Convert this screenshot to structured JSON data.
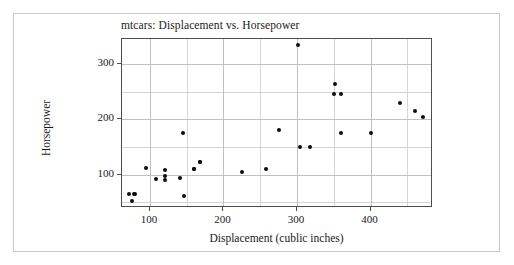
{
  "chart_data": {
    "type": "scatter",
    "title": "mtcars: Displacement vs. Horsepower",
    "xlabel": "Displacement (cublic inches)",
    "ylabel": "Horsepower",
    "xlim": [
      62,
      485
    ],
    "ylim": [
      40,
      345
    ],
    "grid": true,
    "legend": null,
    "xticks": [
      100,
      200,
      300,
      400
    ],
    "yticks": [
      100,
      200,
      300
    ],
    "x_minor_gridlines": [
      150,
      250,
      350,
      450
    ],
    "y_minor_gridlines": [
      50,
      150,
      250
    ],
    "marker": "filled-circle",
    "marker_color": "#0d0d0d",
    "points": [
      {
        "x": 71.1,
        "y": 65
      },
      {
        "x": 75.7,
        "y": 52
      },
      {
        "x": 78.7,
        "y": 66
      },
      {
        "x": 79.0,
        "y": 66
      },
      {
        "x": 95.1,
        "y": 113
      },
      {
        "x": 108.0,
        "y": 93
      },
      {
        "x": 120.1,
        "y": 97
      },
      {
        "x": 120.3,
        "y": 91
      },
      {
        "x": 121.0,
        "y": 109
      },
      {
        "x": 140.8,
        "y": 95
      },
      {
        "x": 145.0,
        "y": 175
      },
      {
        "x": 146.7,
        "y": 62
      },
      {
        "x": 160.0,
        "y": 110
      },
      {
        "x": 160.0,
        "y": 110
      },
      {
        "x": 167.6,
        "y": 123
      },
      {
        "x": 167.6,
        "y": 123
      },
      {
        "x": 225.0,
        "y": 105
      },
      {
        "x": 258.0,
        "y": 110
      },
      {
        "x": 275.8,
        "y": 180
      },
      {
        "x": 301.0,
        "y": 335
      },
      {
        "x": 304.0,
        "y": 150
      },
      {
        "x": 318.0,
        "y": 150
      },
      {
        "x": 350.0,
        "y": 245
      },
      {
        "x": 351.0,
        "y": 264
      },
      {
        "x": 360.0,
        "y": 175
      },
      {
        "x": 360.0,
        "y": 245
      },
      {
        "x": 400.0,
        "y": 175
      },
      {
        "x": 440.0,
        "y": 230
      },
      {
        "x": 460.0,
        "y": 215
      },
      {
        "x": 472.0,
        "y": 205
      }
    ]
  },
  "axis": {
    "x_tick_labels": [
      "100",
      "200",
      "300",
      "400"
    ],
    "y_tick_labels": [
      "100",
      "200",
      "300"
    ]
  }
}
